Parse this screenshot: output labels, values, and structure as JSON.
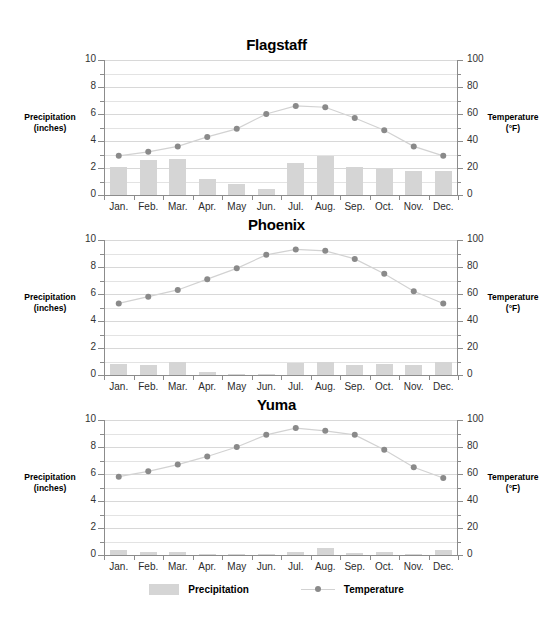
{
  "axis_titles": {
    "left_line1": "Precipitation",
    "left_line2": "(inches)",
    "right_line1": "Temperature",
    "right_line2": "(°F)"
  },
  "legend": {
    "precipitation_label": "Precipitation",
    "temperature_label": "Temperature"
  },
  "chart_data": [
    {
      "type": "bar",
      "title": "Flagstaff",
      "categories": [
        "Jan.",
        "Feb.",
        "Mar.",
        "Apr.",
        "May",
        "Jun.",
        "Jul.",
        "Aug.",
        "Sep.",
        "Oct.",
        "Nov.",
        "Dec."
      ],
      "series": [
        {
          "name": "Precipitation",
          "kind": "bar",
          "axis": "left",
          "unit": "inches",
          "values": [
            2.1,
            2.6,
            2.7,
            1.2,
            0.8,
            0.45,
            2.4,
            2.9,
            2.1,
            1.95,
            1.8,
            1.75
          ]
        },
        {
          "name": "Temperature",
          "kind": "line",
          "axis": "right",
          "unit": "°F",
          "values": [
            29,
            32,
            36,
            43,
            49,
            60,
            66,
            65,
            57,
            48,
            36,
            29
          ]
        }
      ],
      "xlabel": "",
      "ylabel": "Precipitation (inches)",
      "ylabel_right": "Temperature (°F)",
      "ylim": [
        0,
        10
      ],
      "ylim_right": [
        0,
        100
      ],
      "yticks": [
        0,
        2,
        4,
        6,
        8,
        10
      ],
      "yticks_right": [
        0,
        20,
        40,
        60,
        80,
        100
      ],
      "grid": true,
      "legend_position": "bottom"
    },
    {
      "type": "bar",
      "title": "Phoenix",
      "categories": [
        "Jan.",
        "Feb.",
        "Mar.",
        "Apr.",
        "May",
        "Jun.",
        "Jul.",
        "Aug.",
        "Sep.",
        "Oct.",
        "Nov.",
        "Dec."
      ],
      "series": [
        {
          "name": "Precipitation",
          "kind": "bar",
          "axis": "left",
          "unit": "inches",
          "values": [
            0.85,
            0.75,
            1.0,
            0.2,
            0.1,
            0.05,
            0.9,
            0.95,
            0.75,
            0.8,
            0.75,
            0.95
          ]
        },
        {
          "name": "Temperature",
          "kind": "line",
          "axis": "right",
          "unit": "°F",
          "values": [
            53,
            58,
            63,
            71,
            79,
            89,
            93,
            92,
            86,
            75,
            62,
            53
          ]
        }
      ],
      "xlabel": "",
      "ylabel": "Precipitation (inches)",
      "ylabel_right": "Temperature (°F)",
      "ylim": [
        0,
        10
      ],
      "ylim_right": [
        0,
        100
      ],
      "yticks": [
        0,
        2,
        4,
        6,
        8,
        10
      ],
      "yticks_right": [
        0,
        20,
        40,
        60,
        80,
        100
      ],
      "grid": true,
      "legend_position": "bottom"
    },
    {
      "type": "bar",
      "title": "Yuma",
      "categories": [
        "Jan.",
        "Feb.",
        "Mar.",
        "Apr.",
        "May",
        "Jun.",
        "Jul.",
        "Aug.",
        "Sep.",
        "Oct.",
        "Nov.",
        "Dec."
      ],
      "series": [
        {
          "name": "Precipitation",
          "kind": "bar",
          "axis": "left",
          "unit": "inches",
          "values": [
            0.35,
            0.25,
            0.25,
            0.1,
            0.05,
            0.02,
            0.2,
            0.5,
            0.15,
            0.2,
            0.1,
            0.35
          ]
        },
        {
          "name": "Temperature",
          "kind": "line",
          "axis": "right",
          "unit": "°F",
          "values": [
            58,
            62,
            67,
            73,
            80,
            89,
            94,
            92,
            89,
            78,
            65,
            57
          ]
        }
      ],
      "xlabel": "",
      "ylabel": "Precipitation (inches)",
      "ylabel_right": "Temperature (°F)",
      "ylim": [
        0,
        10
      ],
      "ylim_right": [
        0,
        100
      ],
      "yticks": [
        0,
        2,
        4,
        6,
        8,
        10
      ],
      "yticks_right": [
        0,
        20,
        40,
        60,
        80,
        100
      ],
      "grid": true,
      "legend_position": "bottom"
    }
  ],
  "colors": {
    "bar": "#d5d5d5",
    "marker": "#8a8a8a",
    "line": "#d2d2d2",
    "axis": "#8c8c8c",
    "grid": "#e3e3e3",
    "text": "#1a1a1a"
  }
}
